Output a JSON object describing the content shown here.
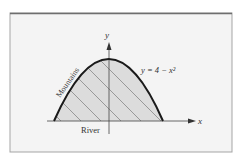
{
  "figure": {
    "equation_label": "y = 4 − x²",
    "mountains_label": "Mountains",
    "river_label": "River",
    "x_axis_label": "x",
    "y_axis_label": "y",
    "colors": {
      "background": "#ffffff",
      "frame_fill": "#f4f4f4",
      "frame_border": "#9a9a9a",
      "frame_top": "#6e6e6e",
      "region_fill": "#dcdcdc",
      "curve": "#1a1a1a",
      "axis": "#444444",
      "hatch": "#666666"
    }
  }
}
